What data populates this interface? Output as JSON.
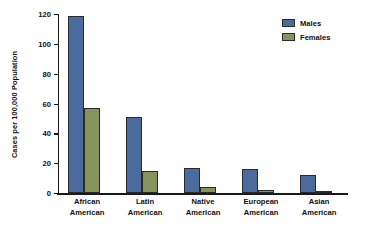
{
  "chart_data": {
    "type": "bar",
    "title": "",
    "subtitle": "",
    "xlabel": "",
    "ylabel": "Cases per 100,000 Population",
    "categories": [
      "African American",
      "Latin American",
      "Native American",
      "European American",
      "Asian American"
    ],
    "category_lines": [
      [
        "African",
        "American"
      ],
      [
        "Latin",
        "American"
      ],
      [
        "Native",
        "American"
      ],
      [
        "European",
        "American"
      ],
      [
        "Asian",
        "American"
      ]
    ],
    "series": [
      {
        "name": "Males",
        "color": "#4a6b9c",
        "values": [
          119,
          51,
          17,
          16,
          12
        ]
      },
      {
        "name": "Females",
        "color": "#84945c",
        "values": [
          57,
          15,
          4,
          2,
          1.5
        ]
      }
    ],
    "ylim": [
      0,
      120
    ],
    "yticks": [
      0,
      20,
      40,
      60,
      80,
      100,
      120
    ],
    "ytick_labels": [
      "0",
      "20",
      "40",
      "60",
      "80",
      "100",
      "120"
    ],
    "grid": false,
    "legend_position": "top-right"
  },
  "legend": {
    "items": [
      {
        "label": "Males",
        "color": "#4a6b9c"
      },
      {
        "label": "Females",
        "color": "#84945c"
      }
    ]
  },
  "axis": {
    "y_title": "Cases per 100,000 Population"
  }
}
